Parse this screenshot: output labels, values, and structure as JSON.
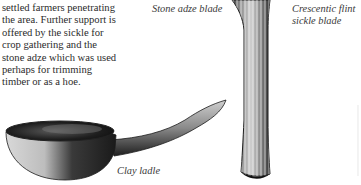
{
  "body_text": {
    "lines": [
      "settled farmers penetrating",
      "the area. Further support is",
      "offered by the sickle for",
      "crop gathering and the",
      "stone adze which was used",
      "perhaps for trimming",
      "timber or as a hoe."
    ]
  },
  "captions": {
    "adze": "Stone adze blade",
    "sickle": [
      "Crescentic flint",
      "sickle blade"
    ],
    "ladle": "Clay ladle"
  },
  "illustrations": {
    "adze": "stone-adze-blade-drawing",
    "ladle": "clay-ladle-drawing"
  },
  "colors": {
    "ink": "#2a2a2a",
    "paper": "#ffffff"
  }
}
